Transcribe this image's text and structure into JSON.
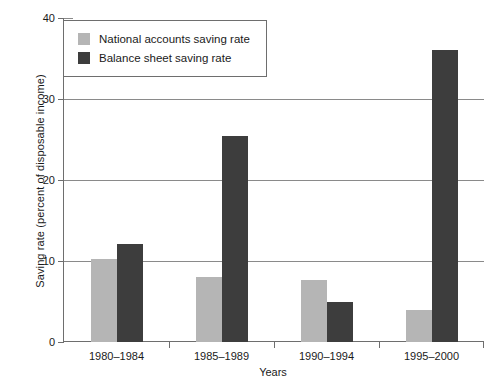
{
  "chart_data": {
    "type": "bar",
    "title": "",
    "xlabel": "Years",
    "ylabel": "Saving rate (percent of disposable income)",
    "categories": [
      "1980–1984",
      "1985–1989",
      "1990–1994",
      "1995–2000"
    ],
    "series": [
      {
        "name": "National accounts saving rate",
        "color": "#b5b5b5",
        "values": [
          10.3,
          8.0,
          7.6,
          4.0
        ]
      },
      {
        "name": "Balance sheet saving rate",
        "color": "#3d3d3d",
        "values": [
          12.1,
          25.4,
          4.9,
          36.0
        ]
      }
    ],
    "ylim": [
      0,
      40
    ],
    "yticks": [
      0,
      10,
      20,
      30,
      40
    ],
    "ytick_labels": [
      "0",
      "10",
      "20",
      "30",
      "40"
    ],
    "grid": "horizontal",
    "legend_position": "upper left"
  },
  "axes": {
    "y_title": "Saving rate (percent of disposable income)",
    "x_title": "Years"
  },
  "legend": {
    "entries": [
      {
        "label": "National accounts saving rate",
        "color": "#b5b5b5"
      },
      {
        "label": "Balance sheet saving rate",
        "color": "#3d3d3d"
      }
    ]
  },
  "colors": {
    "series_light": "#b5b5b5",
    "series_dark": "#3d3d3d",
    "axis": "#6e6e6e",
    "gridline": "#8a8a8a",
    "background": "#ffffff"
  }
}
